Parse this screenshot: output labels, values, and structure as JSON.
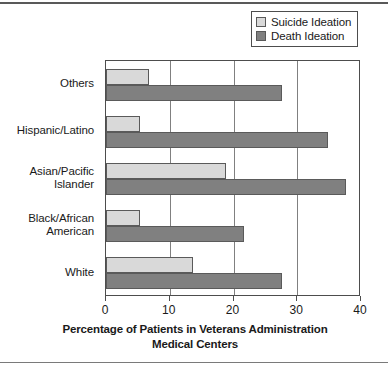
{
  "chart_data": {
    "type": "bar",
    "orientation": "horizontal",
    "title": "",
    "xlabel": "Percentage of Patients in Veterans Administration Medical Centers",
    "ylabel": "",
    "xlim": [
      0,
      40
    ],
    "xticks": [
      0,
      10,
      20,
      30,
      40
    ],
    "xtick_labels": [
      "0",
      "10",
      "20",
      "30",
      "40"
    ],
    "grid": "vertical",
    "legend_position": "top-right",
    "categories": [
      "Others",
      "Hispanic/Latino",
      "Asian/Pacific\nIslander",
      "Black/African\nAmerican",
      "White"
    ],
    "series": [
      {
        "name": "Suicide Ideation",
        "color": "#d9d9d9",
        "values": [
          6.8,
          5.3,
          18.9,
          5.3,
          13.7
        ]
      },
      {
        "name": "Death Ideation",
        "color": "#808080",
        "values": [
          27.6,
          34.8,
          37.7,
          21.7,
          27.6
        ]
      }
    ]
  },
  "xtitle": {
    "line1": "Percentage of Patients in Veterans Administration",
    "line2": "Medical Centers"
  }
}
